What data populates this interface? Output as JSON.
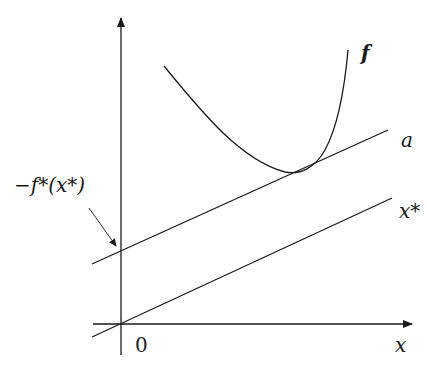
{
  "diagram": {
    "type": "conjugate-function-illustration",
    "axes": {
      "x_label": "x",
      "origin_label": "0"
    },
    "curve": {
      "label": "f",
      "description": "convex function"
    },
    "lines": [
      {
        "label": "a",
        "description": "supporting line tangent to f"
      },
      {
        "label": "x*",
        "description": "line through origin with slope x*"
      }
    ],
    "annotation": {
      "label": "−f*(x*)",
      "description": "y-intercept of tangent line a"
    },
    "colors": {
      "stroke": "#1a1a1a",
      "background": "#ffffff"
    }
  }
}
